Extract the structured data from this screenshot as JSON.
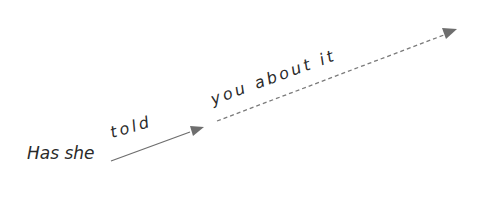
{
  "diagram": {
    "words": {
      "start": "Has she",
      "rise": "told",
      "continuation": "you about it"
    },
    "colors": {
      "text": "#2a2a2a",
      "arrow": "#6e6e6e"
    },
    "arrows": [
      {
        "style": "solid",
        "from": [
          111,
          161
        ],
        "to": [
          203,
          128
        ]
      },
      {
        "style": "dashed",
        "from": [
          217,
          121
        ],
        "to": [
          457,
          30
        ]
      }
    ]
  }
}
